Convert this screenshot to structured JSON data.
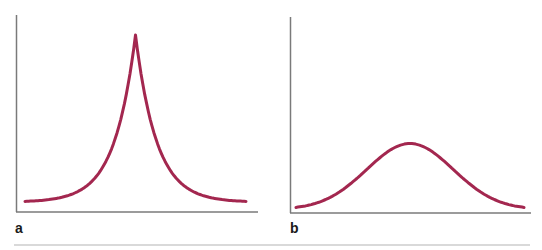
{
  "colors": {
    "curve": "#a3274f",
    "axis": "#7a7a7a",
    "divider": "#d9d9d9",
    "label": "#1a1a1a"
  },
  "panels": [
    {
      "label": "a"
    },
    {
      "label": "b"
    }
  ],
  "chart_data": [
    {
      "type": "line",
      "title": "",
      "panel_label": "a",
      "xlabel": "",
      "ylabel": "",
      "description": "Sharply peaked (cusp-like, Laplace/Lorentzian) symmetric curve",
      "grid": false,
      "x": [
        -1.0,
        -0.8,
        -0.6,
        -0.4,
        -0.3,
        -0.2,
        -0.1,
        0.0,
        0.1,
        0.2,
        0.3,
        0.4,
        0.6,
        0.8,
        1.0
      ],
      "values": [
        0.06,
        0.08,
        0.12,
        0.21,
        0.29,
        0.42,
        0.65,
        1.0,
        0.65,
        0.42,
        0.29,
        0.21,
        0.12,
        0.08,
        0.06
      ],
      "ylim": [
        0,
        1.1
      ]
    },
    {
      "type": "line",
      "title": "",
      "panel_label": "b",
      "xlabel": "",
      "ylabel": "",
      "description": "Broad, flat Gaussian-like symmetric curve",
      "grid": false,
      "x": [
        -1.0,
        -0.8,
        -0.6,
        -0.4,
        -0.2,
        0.0,
        0.2,
        0.4,
        0.6,
        0.8,
        1.0
      ],
      "values": [
        0.04,
        0.12,
        0.22,
        0.31,
        0.37,
        0.39,
        0.37,
        0.31,
        0.22,
        0.12,
        0.04
      ],
      "ylim": [
        0,
        1.1
      ]
    }
  ]
}
